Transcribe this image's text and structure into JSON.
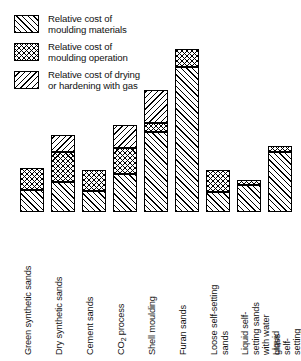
{
  "legend": {
    "items": [
      {
        "pattern": "forward-hatch",
        "label": "Relative cost of\nmoulding materials"
      },
      {
        "pattern": "cross-hatch",
        "label": "Relative cost of\nmoulding operation"
      },
      {
        "pattern": "back-hatch",
        "label": "Relative cost of drying\nor hardening with gas"
      }
    ]
  },
  "chart_data": {
    "type": "bar",
    "stacked": true,
    "title": "",
    "xlabel": "",
    "ylabel": "",
    "grid": false,
    "legend_position": "top-left",
    "axis_ticks_shown": false,
    "ylim": [
      0,
      163
    ],
    "categories": [
      "Green synthetic sands",
      "Dry synthetic sands",
      "Cement sands",
      "CO2 process",
      "Shell moulding",
      "Furan sands",
      "Loose self-setting sands",
      "Liquid self-setting sands\nwith water glass",
      "Liquid self-setting sands\nwith synthetic resin"
    ],
    "series": [
      {
        "name": "Relative cost of moulding materials",
        "pattern": "forward-hatch",
        "values": [
          22,
          30,
          21,
          38,
          80,
          145,
          20,
          27,
          60
        ]
      },
      {
        "name": "Relative cost of moulding operation",
        "pattern": "cross-hatch",
        "values": [
          22,
          30,
          21,
          26,
          9,
          18,
          22,
          5,
          6
        ]
      },
      {
        "name": "Relative cost of drying or hardening with gas",
        "pattern": "back-hatch",
        "values": [
          0,
          17,
          0,
          23,
          33,
          0,
          0,
          0,
          0
        ]
      }
    ],
    "totals": [
      44,
      77,
      42,
      87,
      122,
      163,
      42,
      32,
      66
    ]
  }
}
